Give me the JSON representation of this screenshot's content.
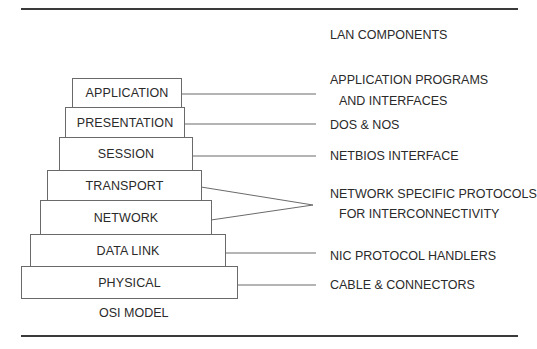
{
  "title": "LAN COMPONENTS",
  "model_caption": "OSI MODEL",
  "layers": [
    {
      "name": "APPLICATION"
    },
    {
      "name": "PRESENTATION"
    },
    {
      "name": "SESSION"
    },
    {
      "name": "TRANSPORT"
    },
    {
      "name": "NETWORK"
    },
    {
      "name": "DATA LINK"
    },
    {
      "name": "PHYSICAL"
    }
  ],
  "components": [
    {
      "line1": "APPLICATION PROGRAMS",
      "line2": "AND INTERFACES",
      "layers": [
        "APPLICATION"
      ]
    },
    {
      "line1": "DOS & NOS",
      "layers": [
        "PRESENTATION"
      ]
    },
    {
      "line1": "NETBIOS INTERFACE",
      "layers": [
        "SESSION"
      ]
    },
    {
      "line1": "NETWORK SPECIFIC PROTOCOLS",
      "line2": "FOR INTERCONNECTIVITY",
      "layers": [
        "TRANSPORT",
        "NETWORK"
      ]
    },
    {
      "line1": "NIC PROTOCOL HANDLERS",
      "layers": [
        "DATA LINK"
      ]
    },
    {
      "line1": "CABLE & CONNECTORS",
      "layers": [
        "PHYSICAL"
      ]
    }
  ]
}
